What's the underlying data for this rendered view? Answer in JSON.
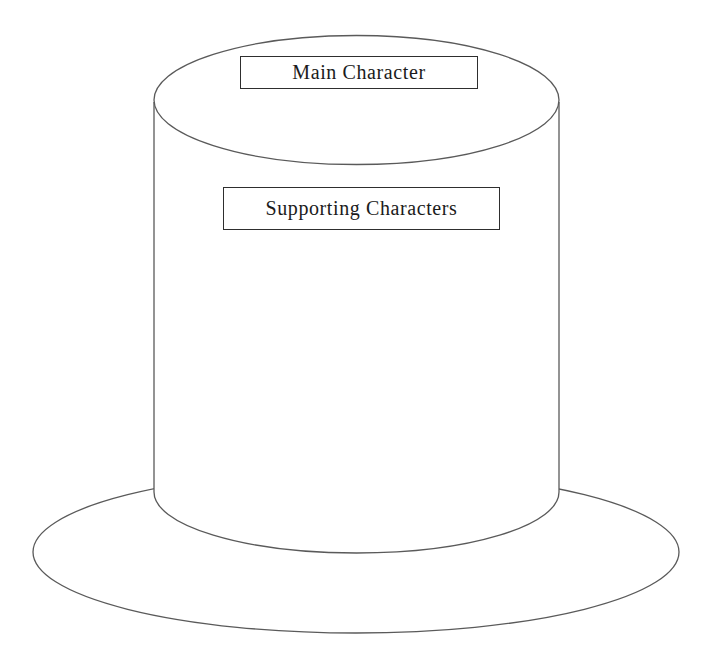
{
  "diagram": {
    "type": "top-hat-character-diagram",
    "top_label": "Main Character",
    "body_label": "Supporting Characters",
    "colors": {
      "background": "#ffffff",
      "line": "#5a5a5a",
      "box_border": "#2e2e2e",
      "text": "#1b1b1b"
    }
  }
}
